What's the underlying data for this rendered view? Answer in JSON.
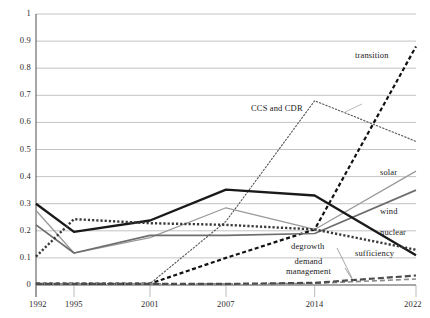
{
  "chart_data": {
    "type": "line",
    "title": "",
    "subtitle": "",
    "xlabel": "",
    "ylabel": "",
    "x": [
      1992,
      1995,
      2001,
      2007,
      2014,
      2022
    ],
    "xtick_labels": [
      "1992",
      "1995",
      "2001",
      "2007",
      "2014",
      "2022"
    ],
    "ytick_labels": [
      "0",
      "0.1",
      "0.2",
      "0.3",
      "0.4",
      "0.5",
      "0.6",
      "0.7",
      "0.8",
      "0.9",
      "1"
    ],
    "ytick_values": [
      0,
      0.1,
      0.2,
      0.3,
      0.4,
      0.5,
      0.6,
      0.7,
      0.8,
      0.9,
      1
    ],
    "ylim": [
      0,
      1
    ],
    "xlim": [
      1992,
      2022
    ],
    "grid": "horizontal",
    "legend_position": "inline-end-of-line",
    "series": [
      {
        "name": "transition",
        "label": "transition",
        "style": "dashed-heavy",
        "color": "#111111",
        "values": [
          0.005,
          0.005,
          0.005,
          0.1,
          0.205,
          0.88
        ]
      },
      {
        "name": "CCS and CDR",
        "label": "CCS and CDR",
        "style": "dotted-fine",
        "color": "#555555",
        "values": [
          0.005,
          0.005,
          0.005,
          0.235,
          0.68,
          0.53
        ]
      },
      {
        "name": "solar",
        "label": "solar",
        "style": "solid-light",
        "color": "#9a9a9a",
        "values": [
          0.275,
          0.118,
          0.175,
          0.285,
          0.205,
          0.42
        ]
      },
      {
        "name": "wind",
        "label": "wind",
        "style": "solid-medium",
        "color": "#6e6e6e",
        "values": [
          0.222,
          0.118,
          0.183,
          0.183,
          0.19,
          0.35
        ]
      },
      {
        "name": "nuclear",
        "label": "nuclear",
        "style": "solid-heavy",
        "color": "#1a1a1a",
        "values": [
          0.3,
          0.196,
          0.238,
          0.352,
          0.33,
          0.11
        ]
      },
      {
        "name": "sufficiency",
        "label": "sufficiency",
        "style": "dotted-heavy",
        "color": "#3a3a3a",
        "values": [
          0.105,
          0.243,
          0.228,
          0.222,
          0.205,
          0.13
        ]
      },
      {
        "name": "degrowth",
        "label": "degrowth",
        "style": "dashed-light",
        "color": "#8a8a8a",
        "values": [
          0.004,
          0.004,
          0.004,
          0.004,
          0.006,
          0.022
        ]
      },
      {
        "name": "demand management",
        "label": "demand management",
        "label_line1": "demand",
        "label_line2": "management",
        "style": "dashed-medium",
        "color": "#4d4d4d",
        "values": [
          0.004,
          0.004,
          0.004,
          0.004,
          0.008,
          0.035
        ]
      }
    ],
    "annotations": [
      {
        "text": "transition",
        "series": "transition"
      },
      {
        "text": "CCS and CDR",
        "series": "CCS and CDR"
      },
      {
        "text": "solar",
        "series": "solar"
      },
      {
        "text": "wind",
        "series": "wind"
      },
      {
        "text": "nuclear",
        "series": "nuclear"
      },
      {
        "text": "sufficiency",
        "series": "sufficiency"
      },
      {
        "text": "degrowth",
        "series": "degrowth"
      },
      {
        "text": "demand management",
        "series": "demand management"
      }
    ]
  }
}
